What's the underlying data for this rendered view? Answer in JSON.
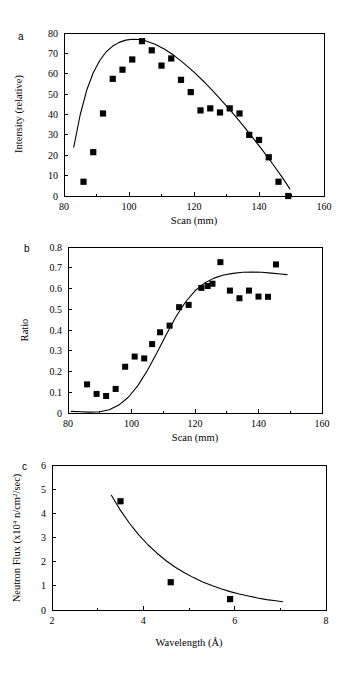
{
  "figure": {
    "panel_count": 3,
    "background_color": "#ffffff",
    "ink_color": "#000000"
  },
  "chart_data": [
    {
      "panel_label": "a",
      "type": "scatter",
      "title": "",
      "xlabel": "Scan (mm)",
      "ylabel": "Intensity (relative)",
      "xlim": [
        80,
        160
      ],
      "ylim": [
        0,
        80
      ],
      "xticks": [
        80,
        100,
        120,
        140,
        160
      ],
      "xtick_labels": [
        "80",
        "100",
        "120",
        "140",
        "160"
      ],
      "xminor": [
        90,
        110,
        130,
        150
      ],
      "yticks": [
        0,
        10,
        20,
        30,
        40,
        50,
        60,
        70,
        80
      ],
      "ytick_labels": [
        "0",
        "10",
        "20",
        "30",
        "40",
        "50",
        "60",
        "70",
        "80"
      ],
      "grid": false,
      "legend": "none",
      "marker": "square",
      "points": [
        {
          "x": 86.0,
          "y": 7.0
        },
        {
          "x": 89.0,
          "y": 21.5
        },
        {
          "x": 92.0,
          "y": 40.5
        },
        {
          "x": 95.0,
          "y": 57.5
        },
        {
          "x": 98.0,
          "y": 62.0
        },
        {
          "x": 101.0,
          "y": 67.0
        },
        {
          "x": 104.0,
          "y": 76.0
        },
        {
          "x": 107.0,
          "y": 71.5
        },
        {
          "x": 110.0,
          "y": 64.0
        },
        {
          "x": 113.0,
          "y": 67.5
        },
        {
          "x": 116.0,
          "y": 57.0
        },
        {
          "x": 119.0,
          "y": 51.0
        },
        {
          "x": 122.0,
          "y": 42.0
        },
        {
          "x": 125.0,
          "y": 43.0
        },
        {
          "x": 128.0,
          "y": 41.0
        },
        {
          "x": 131.0,
          "y": 43.0
        },
        {
          "x": 134.0,
          "y": 40.5
        },
        {
          "x": 137.0,
          "y": 30.0
        },
        {
          "x": 140.0,
          "y": 27.5
        },
        {
          "x": 143.0,
          "y": 19.0
        },
        {
          "x": 146.0,
          "y": 7.0
        },
        {
          "x": 149.0,
          "y": 0.0
        }
      ],
      "fit_curve": [
        {
          "x": 83.0,
          "y": 24.0
        },
        {
          "x": 85.0,
          "y": 40.0
        },
        {
          "x": 87.0,
          "y": 52.0
        },
        {
          "x": 89.0,
          "y": 60.5
        },
        {
          "x": 91.0,
          "y": 66.5
        },
        {
          "x": 93.0,
          "y": 70.8
        },
        {
          "x": 95.0,
          "y": 73.6
        },
        {
          "x": 97.0,
          "y": 75.4
        },
        {
          "x": 99.0,
          "y": 76.5
        },
        {
          "x": 101.0,
          "y": 76.9
        },
        {
          "x": 103.0,
          "y": 76.8
        },
        {
          "x": 105.0,
          "y": 76.2
        },
        {
          "x": 108.0,
          "y": 74.5
        },
        {
          "x": 111.0,
          "y": 72.0
        },
        {
          "x": 114.0,
          "y": 68.8
        },
        {
          "x": 117.0,
          "y": 65.0
        },
        {
          "x": 120.0,
          "y": 60.8
        },
        {
          "x": 123.0,
          "y": 56.2
        },
        {
          "x": 126.0,
          "y": 51.2
        },
        {
          "x": 129.0,
          "y": 46.0
        },
        {
          "x": 132.0,
          "y": 40.5
        },
        {
          "x": 135.0,
          "y": 34.8
        },
        {
          "x": 138.0,
          "y": 28.8
        },
        {
          "x": 141.0,
          "y": 22.6
        },
        {
          "x": 144.0,
          "y": 16.2
        },
        {
          "x": 147.0,
          "y": 9.5
        },
        {
          "x": 149.5,
          "y": 3.5
        }
      ]
    },
    {
      "panel_label": "b",
      "type": "scatter",
      "title": "",
      "xlabel": "Scan (mm)",
      "ylabel": "Ratio",
      "xlim": [
        80,
        160
      ],
      "ylim": [
        0,
        0.8
      ],
      "xticks": [
        80,
        100,
        120,
        140,
        160
      ],
      "xtick_labels": [
        "80",
        "100",
        "120",
        "140",
        "160"
      ],
      "xminor": [
        90,
        110,
        130,
        150
      ],
      "yticks": [
        0,
        0.1,
        0.2,
        0.3,
        0.4,
        0.5,
        0.6,
        0.7,
        0.8
      ],
      "ytick_labels": [
        "0",
        "0.1",
        "0.2",
        "0.3",
        "0.4",
        "0.5",
        "0.6",
        "0.7",
        "0.8"
      ],
      "grid": false,
      "legend": "none",
      "marker": "square",
      "points": [
        {
          "x": 86.0,
          "y": 0.138
        },
        {
          "x": 89.0,
          "y": 0.092
        },
        {
          "x": 92.0,
          "y": 0.082
        },
        {
          "x": 95.0,
          "y": 0.116
        },
        {
          "x": 98.0,
          "y": 0.223
        },
        {
          "x": 101.0,
          "y": 0.272
        },
        {
          "x": 104.0,
          "y": 0.263
        },
        {
          "x": 106.5,
          "y": 0.332
        },
        {
          "x": 109.0,
          "y": 0.389
        },
        {
          "x": 112.0,
          "y": 0.421
        },
        {
          "x": 115.0,
          "y": 0.51
        },
        {
          "x": 118.0,
          "y": 0.521
        },
        {
          "x": 122.0,
          "y": 0.603
        },
        {
          "x": 124.0,
          "y": 0.612
        },
        {
          "x": 125.5,
          "y": 0.623
        },
        {
          "x": 128.0,
          "y": 0.727
        },
        {
          "x": 131.0,
          "y": 0.59
        },
        {
          "x": 134.0,
          "y": 0.553
        },
        {
          "x": 137.0,
          "y": 0.59
        },
        {
          "x": 140.0,
          "y": 0.561
        },
        {
          "x": 143.0,
          "y": 0.56
        },
        {
          "x": 145.5,
          "y": 0.716
        }
      ],
      "fit_curve": [
        {
          "x": 81.0,
          "y": 0.008
        },
        {
          "x": 84.0,
          "y": 0.006
        },
        {
          "x": 87.0,
          "y": 0.004
        },
        {
          "x": 90.0,
          "y": 0.006
        },
        {
          "x": 93.0,
          "y": 0.016
        },
        {
          "x": 96.0,
          "y": 0.038
        },
        {
          "x": 99.0,
          "y": 0.076
        },
        {
          "x": 102.0,
          "y": 0.132
        },
        {
          "x": 105.0,
          "y": 0.205
        },
        {
          "x": 108.0,
          "y": 0.29
        },
        {
          "x": 111.0,
          "y": 0.38
        },
        {
          "x": 114.0,
          "y": 0.464
        },
        {
          "x": 117.0,
          "y": 0.535
        },
        {
          "x": 120.0,
          "y": 0.589
        },
        {
          "x": 123.0,
          "y": 0.626
        },
        {
          "x": 126.0,
          "y": 0.65
        },
        {
          "x": 129.0,
          "y": 0.665
        },
        {
          "x": 132.0,
          "y": 0.673
        },
        {
          "x": 135.0,
          "y": 0.678
        },
        {
          "x": 138.0,
          "y": 0.679
        },
        {
          "x": 141.0,
          "y": 0.678
        },
        {
          "x": 144.0,
          "y": 0.674
        },
        {
          "x": 147.0,
          "y": 0.67
        },
        {
          "x": 149.0,
          "y": 0.667
        }
      ]
    },
    {
      "panel_label": "c",
      "type": "scatter",
      "title": "",
      "xlabel": "Wavelength (Å)",
      "ylabel_prefix": "Neutron Flux (x10",
      "ylabel_exp1": "4",
      "ylabel_mid": " n/cm",
      "ylabel_exp2": "2",
      "ylabel_suffix": "/sec)",
      "ylabel": "Neutron Flux (x10⁴ n/cm²/sec)",
      "xlim": [
        2,
        8
      ],
      "ylim": [
        0,
        6
      ],
      "xticks": [
        2,
        4,
        6,
        8
      ],
      "xtick_labels": [
        "2",
        "4",
        "6",
        "8"
      ],
      "xminor": [
        3,
        5,
        7
      ],
      "yticks": [
        0,
        1,
        2,
        3,
        4,
        5,
        6
      ],
      "ytick_labels": [
        "0",
        "1",
        "2",
        "3",
        "4",
        "5",
        "6"
      ],
      "grid": false,
      "legend": "none",
      "marker": "square",
      "points": [
        {
          "x": 3.5,
          "y": 4.5
        },
        {
          "x": 4.6,
          "y": 1.15
        },
        {
          "x": 5.9,
          "y": 0.45
        }
      ],
      "fit_curve": [
        {
          "x": 3.3,
          "y": 4.75
        },
        {
          "x": 3.5,
          "y": 4.12
        },
        {
          "x": 3.7,
          "y": 3.58
        },
        {
          "x": 3.9,
          "y": 3.11
        },
        {
          "x": 4.1,
          "y": 2.7
        },
        {
          "x": 4.3,
          "y": 2.35
        },
        {
          "x": 4.5,
          "y": 2.04
        },
        {
          "x": 4.7,
          "y": 1.77
        },
        {
          "x": 4.9,
          "y": 1.54
        },
        {
          "x": 5.1,
          "y": 1.34
        },
        {
          "x": 5.3,
          "y": 1.16
        },
        {
          "x": 5.5,
          "y": 1.01
        },
        {
          "x": 5.7,
          "y": 0.88
        },
        {
          "x": 5.9,
          "y": 0.76
        },
        {
          "x": 6.1,
          "y": 0.66
        },
        {
          "x": 6.3,
          "y": 0.58
        },
        {
          "x": 6.5,
          "y": 0.5
        },
        {
          "x": 6.7,
          "y": 0.43
        },
        {
          "x": 6.9,
          "y": 0.38
        },
        {
          "x": 7.05,
          "y": 0.34
        }
      ]
    }
  ]
}
